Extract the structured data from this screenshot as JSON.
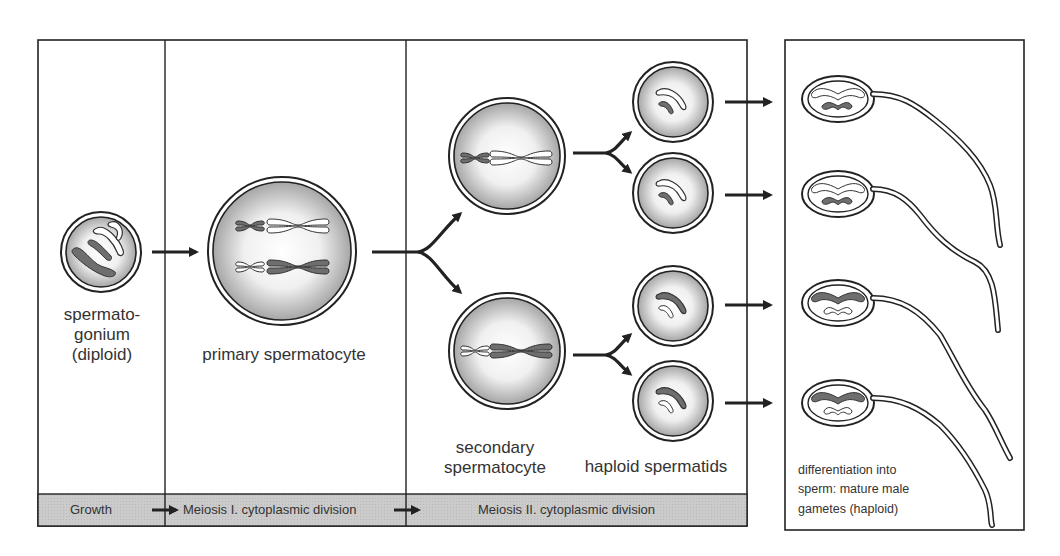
{
  "diagram": {
    "stages": {
      "spermatogonium": {
        "label": "spermato-\ngonium\n(diploid)",
        "line1": "spermato-",
        "line2": "gonium",
        "line3": "(diploid)"
      },
      "primary": {
        "label": "primary spermatocyte"
      },
      "secondary": {
        "line1": "secondary",
        "line2": "spermatocyte"
      },
      "spermatids": {
        "label": "haploid spermatids"
      },
      "sperm": {
        "line1": "differentiation into",
        "line2": "sperm: mature male",
        "line3": "gametes (haploid)"
      }
    },
    "phase_band": {
      "growth": "Growth",
      "meiosis1": "Meiosis I. cytoplasmic division",
      "meiosis2": "Meiosis II. cytoplasmic division"
    },
    "colors": {
      "line": "#222222",
      "band_fill": "#c8c8c8",
      "dark_chromosome": "#6e6e6e",
      "cell_fill_edge": "#a8a8a8",
      "cell_fill_center": "#ffffff"
    },
    "counts": {
      "secondary_spermatocytes": 2,
      "spermatids": 4,
      "sperm": 4
    }
  }
}
